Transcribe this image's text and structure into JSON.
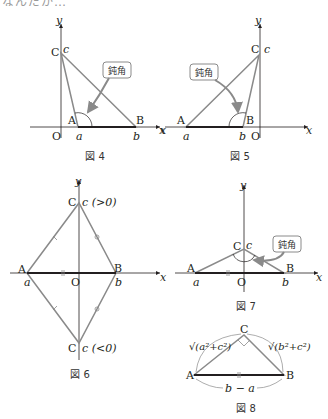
{
  "top_clipped_text": "なんだか…",
  "colors": {
    "triangle_edge": "#8a8a8a",
    "base_edge": "#231f20",
    "axis": "#231f20",
    "callout_border": "#8a8a8a",
    "arrow": "#8a8a8a"
  },
  "figures": [
    {
      "id": "fig4",
      "caption": "図 4",
      "axis_x": "x",
      "axis_y": "y",
      "origin": "O",
      "points": {
        "A": "A",
        "B": "B",
        "C": "C"
      },
      "coords": {
        "a": "a",
        "b": "b",
        "c": "c"
      },
      "callout": "鈍角"
    },
    {
      "id": "fig5",
      "caption": "図 5",
      "axis_x": "x",
      "axis_x_left": "x",
      "axis_y": "y",
      "origin": "O",
      "points": {
        "A": "A",
        "B": "B",
        "C": "C"
      },
      "coords": {
        "a": "a",
        "b": "b",
        "c": "c"
      },
      "callout": "鈍角"
    },
    {
      "id": "fig6",
      "caption": "図 6",
      "axis_x": "x",
      "axis_y": "y",
      "origin": "O",
      "points": {
        "A": "A",
        "B": "B",
        "C_top": "C",
        "C_bottom": "C"
      },
      "coords": {
        "a": "a",
        "b": "b",
        "c_top": "c (>0)",
        "c_bottom": "c (<0)"
      }
    },
    {
      "id": "fig7",
      "caption": "図 7",
      "axis_x": "x",
      "axis_y": "y",
      "origin": "O",
      "points": {
        "A": "A",
        "B": "B",
        "C": "C"
      },
      "coords": {
        "a": "a",
        "b": "b",
        "c": "c"
      },
      "callout": "鈍角"
    },
    {
      "id": "fig8",
      "caption": "図 8",
      "points": {
        "A": "A",
        "B": "B",
        "C": "C"
      },
      "lengths": {
        "AC": "√(a²+c²)",
        "BC": "√(b²+c²)",
        "AB": "b − a"
      }
    }
  ]
}
